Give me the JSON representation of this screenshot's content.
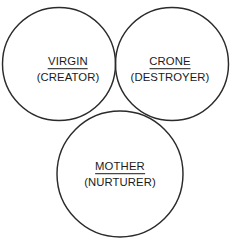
{
  "diagram": {
    "type": "venn-three-circle",
    "background_color": "#ffffff",
    "stroke_color": "#2b2b2b",
    "text_color": "#1b1b1b",
    "circles": [
      {
        "name": "virgin",
        "cx": 59,
        "cy": 64,
        "r": 56.5
      },
      {
        "name": "crone",
        "cx": 172,
        "cy": 64,
        "r": 56.5
      },
      {
        "name": "mother",
        "cx": 120,
        "cy": 174,
        "r": 63.0
      }
    ],
    "labels": [
      {
        "id": "virgin",
        "title": "VIRGIN",
        "subtitle": "(CREATOR)"
      },
      {
        "id": "crone",
        "title": "CRONE",
        "subtitle": "(DESTROYER)"
      },
      {
        "id": "mother",
        "title": "MOTHER",
        "subtitle": "(NURTURER)"
      }
    ]
  }
}
